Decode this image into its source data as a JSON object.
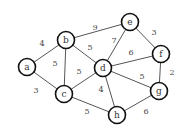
{
  "graph": {
    "type": "weighted-undirected",
    "node_radius": 8.5,
    "nodes": [
      {
        "id": "a",
        "label": "a",
        "x": 27,
        "y": 67
      },
      {
        "id": "b",
        "label": "b",
        "x": 66,
        "y": 40
      },
      {
        "id": "c",
        "label": "c",
        "x": 64,
        "y": 94
      },
      {
        "id": "d",
        "label": "d",
        "x": 103,
        "y": 68
      },
      {
        "id": "e",
        "label": "e",
        "x": 130,
        "y": 22
      },
      {
        "id": "f",
        "label": "f",
        "x": 161,
        "y": 54
      },
      {
        "id": "g",
        "label": "g",
        "x": 159,
        "y": 91
      },
      {
        "id": "h",
        "label": "h",
        "x": 117,
        "y": 115
      }
    ],
    "edges": [
      {
        "from": "a",
        "to": "b",
        "weight": "4",
        "lx": 42,
        "ly": 43
      },
      {
        "from": "a",
        "to": "c",
        "weight": "3",
        "lx": 36,
        "ly": 90
      },
      {
        "from": "b",
        "to": "c",
        "weight": "5",
        "lx": 55,
        "ly": 63
      },
      {
        "from": "b",
        "to": "e",
        "weight": "9",
        "lx": 95,
        "ly": 27
      },
      {
        "from": "b",
        "to": "d",
        "weight": "5",
        "lx": 90,
        "ly": 47
      },
      {
        "from": "c",
        "to": "d",
        "weight": "5",
        "lx": 79,
        "ly": 71
      },
      {
        "from": "c",
        "to": "h",
        "weight": "5",
        "lx": 87,
        "ly": 111
      },
      {
        "from": "d",
        "to": "e",
        "weight": "7",
        "lx": 114,
        "ly": 40
      },
      {
        "from": "d",
        "to": "f",
        "weight": "6",
        "lx": 131,
        "ly": 52
      },
      {
        "from": "d",
        "to": "g",
        "weight": "5",
        "lx": 142,
        "ly": 76
      },
      {
        "from": "d",
        "to": "h",
        "weight": "4",
        "lx": 101,
        "ly": 89
      },
      {
        "from": "e",
        "to": "f",
        "weight": "3",
        "lx": 154,
        "ly": 32
      },
      {
        "from": "f",
        "to": "g",
        "weight": "2",
        "lx": 172,
        "ly": 72
      },
      {
        "from": "g",
        "to": "h",
        "weight": "6",
        "lx": 146,
        "ly": 111
      }
    ]
  },
  "colors": {
    "edge": "#555555",
    "node_stroke": "#111111",
    "node_fill": "#ffffff",
    "text": "#333333"
  }
}
